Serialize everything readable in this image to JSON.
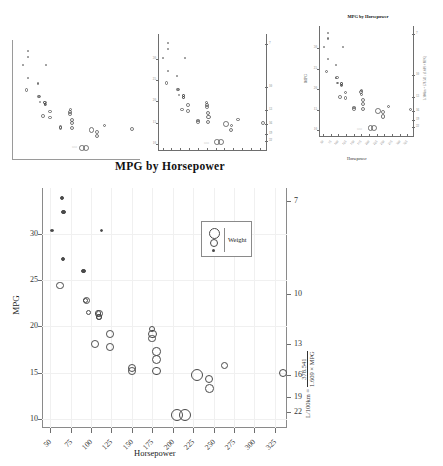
{
  "figure": {
    "supertitle": "MPG by Horsepower",
    "dataset_note": "MPG vs Horsepower bubble chart, bubble area encodes Weight"
  },
  "chart_data": {
    "type": "scatter",
    "title": "MPG by Horsepower",
    "xlabel": "Horsepower",
    "ylabel": "MPG",
    "y2label": "L/100km = 378.541 / (1.609 × MPG)",
    "y2label_parts": {
      "lhs": "L/100km =",
      "numerator": "378.541",
      "denominator": "1.609 × MPG"
    },
    "xlim": [
      40,
      340
    ],
    "ylim": [
      9,
      35
    ],
    "xticks": [
      50,
      75,
      100,
      125,
      150,
      175,
      200,
      225,
      250,
      275,
      300,
      325
    ],
    "yticks": [
      10,
      15,
      20,
      25,
      30
    ],
    "y2ticks": [
      7,
      10,
      13,
      16,
      19,
      22
    ],
    "grid": true,
    "legend": {
      "title": "Weight",
      "position": "upper-right",
      "sizes": [
        "large",
        "medium",
        "small"
      ]
    },
    "size_variable": "Weight",
    "points": [
      {
        "x": 110,
        "y": 21.0,
        "w": 2.62
      },
      {
        "x": 110,
        "y": 21.0,
        "w": 2.875
      },
      {
        "x": 93,
        "y": 22.8,
        "w": 2.32
      },
      {
        "x": 110,
        "y": 21.4,
        "w": 3.215
      },
      {
        "x": 175,
        "y": 18.7,
        "w": 3.44
      },
      {
        "x": 105,
        "y": 18.1,
        "w": 3.46
      },
      {
        "x": 245,
        "y": 14.3,
        "w": 3.57
      },
      {
        "x": 62,
        "y": 24.4,
        "w": 3.19
      },
      {
        "x": 95,
        "y": 22.8,
        "w": 3.15
      },
      {
        "x": 123,
        "y": 19.2,
        "w": 3.44
      },
      {
        "x": 123,
        "y": 17.8,
        "w": 3.44
      },
      {
        "x": 180,
        "y": 16.4,
        "w": 4.07
      },
      {
        "x": 180,
        "y": 17.3,
        "w": 3.73
      },
      {
        "x": 180,
        "y": 15.2,
        "w": 3.78
      },
      {
        "x": 205,
        "y": 10.4,
        "w": 5.25
      },
      {
        "x": 215,
        "y": 10.4,
        "w": 5.424
      },
      {
        "x": 230,
        "y": 14.7,
        "w": 5.345
      },
      {
        "x": 66,
        "y": 32.4,
        "w": 2.2
      },
      {
        "x": 52,
        "y": 30.4,
        "w": 1.615
      },
      {
        "x": 65,
        "y": 33.9,
        "w": 1.835
      },
      {
        "x": 97,
        "y": 21.5,
        "w": 2.465
      },
      {
        "x": 150,
        "y": 15.5,
        "w": 3.52
      },
      {
        "x": 150,
        "y": 15.2,
        "w": 3.435
      },
      {
        "x": 245,
        "y": 13.3,
        "w": 3.84
      },
      {
        "x": 175,
        "y": 19.2,
        "w": 3.845
      },
      {
        "x": 66,
        "y": 27.3,
        "w": 1.935
      },
      {
        "x": 91,
        "y": 26.0,
        "w": 2.14
      },
      {
        "x": 113,
        "y": 30.4,
        "w": 1.513
      },
      {
        "x": 264,
        "y": 15.8,
        "w": 3.17
      },
      {
        "x": 175,
        "y": 19.7,
        "w": 2.77
      },
      {
        "x": 335,
        "y": 15.0,
        "w": 3.57
      },
      {
        "x": 109,
        "y": 21.4,
        "w": 2.78
      }
    ]
  },
  "thumbnails": [
    {
      "name": "thumb-1",
      "title": "",
      "xlabel": "",
      "ylabel": "",
      "has_title": false,
      "has_axis_labels": false,
      "has_tick_labels": false
    },
    {
      "name": "thumb-2",
      "title": "",
      "xlabel": "",
      "ylabel": "",
      "has_title": false,
      "has_axis_labels": false,
      "has_tick_labels": true
    },
    {
      "name": "thumb-3",
      "title": "MPG by Horsepower",
      "xlabel": "Horsepower",
      "ylabel": "MPG",
      "y2label": "L/100km = 378.541 / (1.609 × MPG)",
      "has_title": true,
      "has_axis_labels": true,
      "has_tick_labels": true
    }
  ],
  "colors": {
    "point_stroke": "#4a4a4a",
    "axis": "#8a8a8a",
    "grid": "#f0f0f0",
    "text": "#222222",
    "background": "#ffffff"
  }
}
